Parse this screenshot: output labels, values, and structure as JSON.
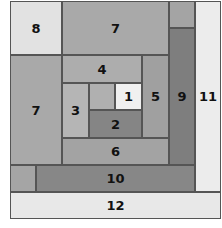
{
  "diagram": {
    "title": "",
    "blocks": [
      {
        "id": "8",
        "label": "8",
        "x": 10,
        "y": 1,
        "w": 52,
        "h": 54,
        "color": "#e2e2e2"
      },
      {
        "id": "7a",
        "label": "7",
        "x": 62,
        "y": 1,
        "w": 107,
        "h": 54,
        "color": "#a9a9a9"
      },
      {
        "id": "tr",
        "label": "",
        "x": 169,
        "y": 1,
        "w": 26,
        "h": 27,
        "color": "#a4a4a4"
      },
      {
        "id": "9",
        "label": "9",
        "x": 169,
        "y": 28,
        "w": 26,
        "h": 137,
        "color": "#7e7e7e"
      },
      {
        "id": "11",
        "label": "11",
        "x": 195,
        "y": 1,
        "w": 26,
        "h": 191,
        "color": "#ececec"
      },
      {
        "id": "7b",
        "label": "7",
        "x": 10,
        "y": 55,
        "w": 52,
        "h": 110,
        "color": "#a9a9a9"
      },
      {
        "id": "4",
        "label": "4",
        "x": 62,
        "y": 55,
        "w": 80,
        "h": 28,
        "color": "#adadad"
      },
      {
        "id": "3",
        "label": "3",
        "x": 62,
        "y": 83,
        "w": 27,
        "h": 55,
        "color": "#b5b5b5"
      },
      {
        "id": "c",
        "label": "",
        "x": 89,
        "y": 83,
        "w": 26,
        "h": 27,
        "color": "#b0b0b0"
      },
      {
        "id": "1",
        "label": "1",
        "x": 115,
        "y": 83,
        "w": 27,
        "h": 27,
        "color": "#f0f0f0"
      },
      {
        "id": "2",
        "label": "2",
        "x": 89,
        "y": 110,
        "w": 53,
        "h": 28,
        "color": "#858585"
      },
      {
        "id": "5",
        "label": "5",
        "x": 142,
        "y": 55,
        "w": 27,
        "h": 83,
        "color": "#a0a0a0"
      },
      {
        "id": "6",
        "label": "6",
        "x": 62,
        "y": 138,
        "w": 107,
        "h": 27,
        "color": "#a3a3a3"
      },
      {
        "id": "bl",
        "label": "",
        "x": 10,
        "y": 165,
        "w": 26,
        "h": 27,
        "color": "#a5a5a5"
      },
      {
        "id": "10",
        "label": "10",
        "x": 36,
        "y": 165,
        "w": 159,
        "h": 27,
        "color": "#878787"
      },
      {
        "id": "12",
        "label": "12",
        "x": 10,
        "y": 192,
        "w": 211,
        "h": 27,
        "color": "#e8e8e8"
      }
    ]
  }
}
